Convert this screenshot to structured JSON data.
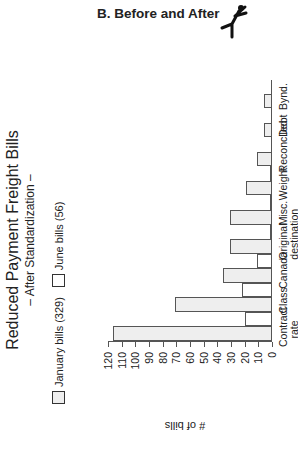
{
  "header": {
    "title": "B. Before and After",
    "icon": "running-figure-icon"
  },
  "chart_data": {
    "type": "bar",
    "orientation_note": "figure rotated 90 degrees counter-clockwise",
    "title": "Reduced Payment Freight Bills",
    "subtitle": "– After Standardization –",
    "xlabel": "",
    "ylabel": "# of bills",
    "ylim": [
      0,
      120
    ],
    "yticks": [
      0,
      10,
      20,
      30,
      40,
      50,
      60,
      70,
      80,
      90,
      100,
      110,
      120
    ],
    "categories": [
      "Contract rate disputes",
      "Class",
      "Canada",
      "Original destination",
      "Misc.",
      "Weight",
      "Reconciled",
      "Debt",
      "Bynd."
    ],
    "series": [
      {
        "name": "January bills (329)",
        "color": "#eeeeee",
        "values": [
          116,
          71,
          36,
          31,
          31,
          19,
          11,
          6,
          6
        ]
      },
      {
        "name": "June bills (56)",
        "color": "#ffffff",
        "values": [
          20,
          22,
          11,
          1,
          1,
          1,
          0,
          0,
          0
        ]
      }
    ],
    "legend": [
      "January bills (329)",
      "June bills (56)"
    ],
    "legend_position": "top",
    "grid": false
  }
}
